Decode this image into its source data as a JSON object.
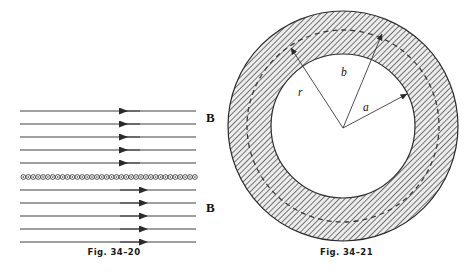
{
  "page": {
    "width": 465,
    "height": 274,
    "background": "#ffffff",
    "ink": "#1a1a1a"
  },
  "figures": [
    {
      "id": "fig-34-20",
      "caption": "Fig. 34–20",
      "description": "Magnetic field lines of a long solenoid shown in cross section, with field reversing direction above and below the winding row",
      "field_labels": [
        {
          "name": "b-label-top",
          "text": "B"
        },
        {
          "name": "b-label-bot",
          "text": "B"
        }
      ],
      "field_lines": {
        "count_above": 5,
        "count_below": 5,
        "arrow_direction_above": "left",
        "arrow_direction_below": "right",
        "x_start": 20,
        "x_end": 196,
        "arrow_x": 132,
        "y_above": [
          111,
          124,
          137,
          150,
          163
        ],
        "y_below": [
          190,
          203,
          216,
          229,
          242
        ]
      },
      "solenoid_row": {
        "name": "solenoid-winding-row",
        "y": 177,
        "x_start": 21,
        "x_end": 196,
        "turn_count": 36,
        "turn_symbol": "current-out-of-page-dot",
        "circle_radius": 2.4
      }
    },
    {
      "id": "fig-34-21",
      "caption": "Fig. 34–21",
      "description": "Toroid shown in cross section as a hatched annulus with a dashed Amperian loop of radius r and labeled radii a and b",
      "center": {
        "x": 343,
        "y": 126
      },
      "outer_radius": 115,
      "inner_radius": 72,
      "amperian_radius": 96,
      "hatch_angle_deg": 45,
      "radius_labels": [
        {
          "name": "label-r",
          "text": "r",
          "target_radius": 96,
          "angle_deg": 124
        },
        {
          "name": "label-b",
          "text": "b",
          "target_radius": 115,
          "angle_deg": 70
        },
        {
          "name": "label-a",
          "text": "a",
          "target_radius": 72,
          "angle_deg": 28
        }
      ]
    }
  ],
  "colors": {
    "line": "#2b2b2b",
    "hatch": "#555555",
    "hatch_fill": "#e9e9e9",
    "dash": "#3a3a3a",
    "text": "#111111"
  }
}
